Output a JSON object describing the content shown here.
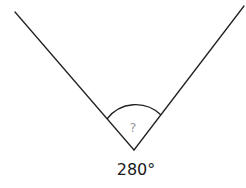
{
  "diagram": {
    "type": "angle",
    "vertex": [
      134,
      150
    ],
    "rays": [
      {
        "name": "left-ray",
        "from": [
          134,
          150
        ],
        "to": [
          15,
          12
        ]
      },
      {
        "name": "right-ray",
        "from": [
          134,
          150
        ],
        "to": [
          244,
          6
        ]
      }
    ],
    "arc": {
      "start": [
        107,
        119
      ],
      "end": [
        161,
        115
      ],
      "radius": 36
    },
    "unknown_marker": "?",
    "angle_label": "280°",
    "colors": {
      "line": "#222222",
      "marker": "#9a9a9a",
      "label": "#1a1a1a",
      "background": "#ffffff"
    }
  }
}
